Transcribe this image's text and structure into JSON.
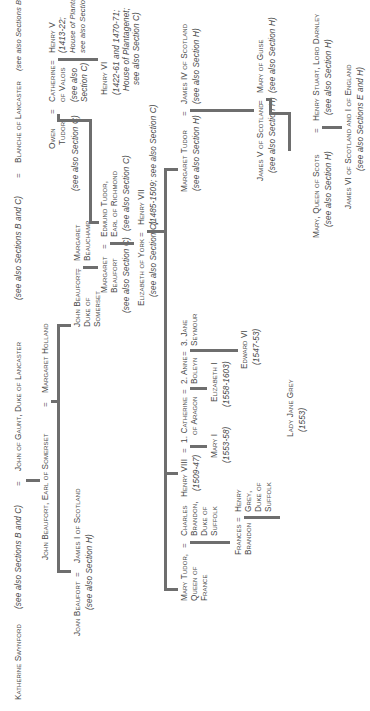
{
  "diagram": {
    "row1": {
      "katherine": "Katherine Swynford",
      "katherine_note": "(see also Sections B and C)",
      "eq1": "=",
      "john_of_gaunt": "John of Gaunt, Duke of Lancaster",
      "john_of_gaunt_note": "(see also Sections B and C)",
      "eq2": "=",
      "blanche": "Blanche of Lancaster",
      "blanche_note": "(see also Sections B and C)"
    },
    "row2": {
      "john_beaufort_earl": "John Beaufort, Earl of Somerset",
      "eq": "=",
      "margaret_holland": "Margaret Holland"
    },
    "row3": {
      "joan_beaufort": "Joan Beaufort",
      "eq": "=",
      "james_i": "James I of Scotland",
      "james_i_note": "(see also Section H)",
      "john_beaufort_duke_l1": "John Beaufort,",
      "john_beaufort_duke_l2": "Duke of",
      "john_beaufort_duke_l3": "Somerset",
      "eq_beauchamp": "=",
      "margaret_beauchamp_l1": "Margaret",
      "margaret_beauchamp_l2": "Beauchamp",
      "owen_tudor_l1": "Owen",
      "owen_tudor_l2": "Tudor",
      "owen_tudor_note": "(see also Section C)",
      "eq_catherine": "=",
      "catherine_valois_l1": "Catherine",
      "catherine_valois_l2": "of Valois",
      "catherine_valois_note_l1": "(see also",
      "catherine_valois_note_l2": "Section C)",
      "eq_henry_v": "=",
      "henry_v": "Henry V",
      "henry_v_l2": "(1413-22;",
      "henry_v_l3": "House of Plantagenet;",
      "henry_v_l4": "see also Section C)"
    },
    "row4": {
      "margaret_beaufort_l1": "Margaret",
      "margaret_beaufort_l2": "Beaufort",
      "margaret_beaufort_note": "(see also Section C)",
      "eq": "=",
      "edmund_tudor_l1": "Edmund Tudor,",
      "edmund_tudor_l2": "Earl of Richmond",
      "edmund_tudor_note": "(see also Section C)",
      "henry_vi": "Henry VI",
      "henry_vi_l2": "(1422-61 and 1470-71;",
      "henry_vi_l3": "House of Plantagenet;",
      "henry_vi_l4": "see also Section C)"
    },
    "row5": {
      "elizabeth_york": "Elizabeth of York",
      "elizabeth_york_note": "(see also Section C)",
      "eq": "=",
      "henry_vii": "Henry VII",
      "henry_vii_note": "(1485-1509; see also Section C)"
    },
    "row6": {
      "mary_tudor_l1": "Mary Tudor,",
      "mary_tudor_l2": "Queen of",
      "mary_tudor_l3": "France",
      "eq_brandon": "=",
      "charles_brandon_l1": "Charles",
      "charles_brandon_l2": "Brandon,",
      "charles_brandon_l3": "Duke of",
      "charles_brandon_l4": "Suffolk",
      "henry_viii": "Henry VIII",
      "henry_viii_dates": "(1509-47)",
      "eq_w1": "=",
      "catherine_aragon_l1": "1. Catherine",
      "catherine_aragon_l2": "of Aragon",
      "eq_w2": "=",
      "anne_boleyn_l1": "2. Anne",
      "anne_boleyn_l2": "Boleyn",
      "eq_w3": "=",
      "jane_seymour_l1": "3. Jane",
      "jane_seymour_l2": "Seymour",
      "margaret_tudor": "Margaret Tudor",
      "margaret_tudor_note": "(see also Section H)",
      "eq_james_iv": "=",
      "james_iv": "James IV of Scotland",
      "james_iv_note": "(see also Section H)"
    },
    "row7": {
      "frances_brandon_l1": "Frances",
      "frances_brandon_l2": "Brandon",
      "eq_grey": "=",
      "henry_grey_l1": "Henry",
      "henry_grey_l2": "Grey,",
      "henry_grey_l3": "Duke of",
      "henry_grey_l4": "Suffolk",
      "mary_i": "Mary I",
      "mary_i_dates": "(1553-58)",
      "elizabeth_i": "Elizabeth I",
      "elizabeth_i_dates": "(1558-1603)",
      "edward_vi": "Edward VI",
      "edward_vi_dates": "(1547-53)",
      "james_v": "James V of Scotland",
      "james_v_note": "(see also Section H)",
      "eq_guise": "=",
      "mary_guise": "Mary of Guise",
      "mary_guise_note": "(see also Section H)"
    },
    "row8": {
      "lady_jane_grey": "Lady Jane Grey",
      "lady_jane_grey_dates": "(1553)",
      "mary_queen_scots": "Mary, Queen of Scots",
      "mary_queen_scots_note": "(see also Section H)",
      "eq_darnley": "=",
      "henry_stuart": "Henry Stuart, Lord Darnley",
      "henry_stuart_note": "(see also Section H)"
    },
    "row9": {
      "james_vi": "James VI of Scotland and I of England",
      "james_vi_note": "(see also Sections E and H)"
    },
    "line_color": "#6e6e6e",
    "text_color": "#4a4a4a"
  }
}
